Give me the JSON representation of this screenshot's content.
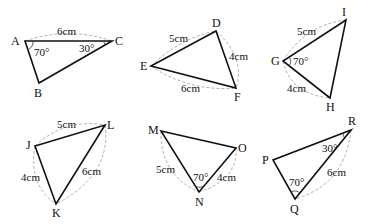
{
  "figure": {
    "triangles": [
      {
        "id": "ABC",
        "vertices": {
          "A": "A",
          "B": "B",
          "C": "C"
        },
        "given": {
          "side_AC": "6cm",
          "angle_A": "70°",
          "angle_C": "30°"
        }
      },
      {
        "id": "DEF",
        "vertices": {
          "D": "D",
          "E": "E",
          "F": "F"
        },
        "given": {
          "side_DE": "5cm",
          "side_DF": "4cm",
          "side_EF": "6cm"
        }
      },
      {
        "id": "GHI",
        "vertices": {
          "G": "G",
          "H": "H",
          "I": "I"
        },
        "given": {
          "side_GI": "5cm",
          "side_GH": "4cm",
          "angle_G": "70°"
        }
      },
      {
        "id": "JKL",
        "vertices": {
          "J": "J",
          "K": "K",
          "L": "L"
        },
        "given": {
          "side_JL": "5cm",
          "side_JK": "4cm",
          "side_KL": "6cm"
        }
      },
      {
        "id": "MNO",
        "vertices": {
          "M": "M",
          "N": "N",
          "O": "O"
        },
        "given": {
          "side_MN": "5cm",
          "side_NO": "4cm",
          "angle_N": "70°"
        }
      },
      {
        "id": "PQR",
        "vertices": {
          "P": "P",
          "Q": "Q",
          "R": "R"
        },
        "given": {
          "side_QR": "6cm",
          "angle_Q": "70°",
          "angle_R": "30°"
        }
      }
    ]
  }
}
